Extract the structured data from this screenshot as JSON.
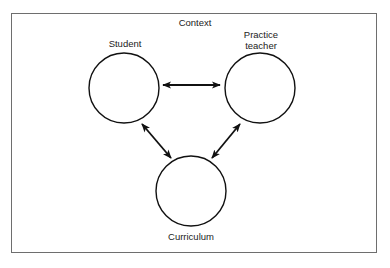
{
  "diagram": {
    "context_label": "Context",
    "nodes": [
      {
        "id": "student",
        "label": "Student"
      },
      {
        "id": "practice_teacher",
        "label_line1": "Practice",
        "label_line2": "teacher"
      },
      {
        "id": "curriculum",
        "label": "Curriculum"
      }
    ],
    "edges": [
      {
        "from": "student",
        "to": "practice_teacher",
        "type": "bidirectional"
      },
      {
        "from": "student",
        "to": "curriculum",
        "type": "bidirectional"
      },
      {
        "from": "practice_teacher",
        "to": "curriculum",
        "type": "bidirectional"
      }
    ],
    "colors": {
      "stroke": "#111111",
      "frame": "#6e6e6e",
      "background": "#ffffff"
    }
  }
}
